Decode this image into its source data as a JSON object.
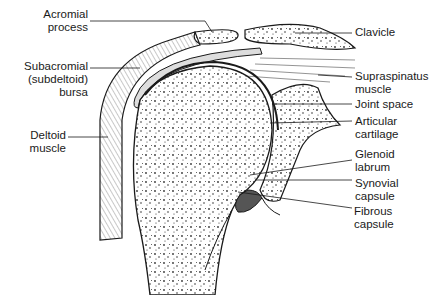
{
  "diagram": {
    "labels_left": [
      {
        "id": "acromial-process",
        "lines": [
          "Acromial",
          "process"
        ]
      },
      {
        "id": "subacromial-bursa",
        "lines": [
          "Subacromial",
          "(subdeltoid)",
          "bursa"
        ]
      },
      {
        "id": "deltoid-muscle",
        "lines": [
          "Deltoid",
          "muscle"
        ]
      }
    ],
    "labels_right": [
      {
        "id": "clavicle",
        "lines": [
          "Clavicle"
        ]
      },
      {
        "id": "supraspinatus-muscle",
        "lines": [
          "Supraspinatus",
          "muscle"
        ]
      },
      {
        "id": "joint-space",
        "lines": [
          "Joint space"
        ]
      },
      {
        "id": "articular-cartilage",
        "lines": [
          "Articular",
          "cartilage"
        ]
      },
      {
        "id": "glenoid-labrum",
        "lines": [
          "Glenoid",
          "labrum"
        ]
      },
      {
        "id": "synovial-capsule",
        "lines": [
          "Synovial",
          "capsule"
        ]
      },
      {
        "id": "fibrous-capsule",
        "lines": [
          "Fibrous",
          "capsule"
        ]
      }
    ],
    "colors": {
      "ink": "#1a1a1a",
      "background": "#ffffff",
      "stipple": "#333333"
    }
  }
}
